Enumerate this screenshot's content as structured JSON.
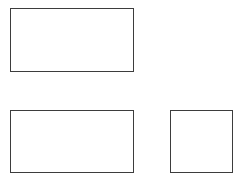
{
  "canvas": {
    "width": 240,
    "height": 180,
    "background_color": "#ffffff"
  },
  "diagram": {
    "title": "",
    "shape_count": 3,
    "default_stroke_color": "#3d3d3d",
    "default_fill_color": "#ffffff",
    "default_stroke_width": 1
  },
  "shapes": [
    {
      "id": "rect-top-left",
      "kind": "rectangle",
      "label": "",
      "x": 10,
      "y": 8,
      "width": 124,
      "height": 64,
      "stroke_color": "#3d3d3d",
      "fill_color": "#ffffff",
      "stroke_width": 1
    },
    {
      "id": "rect-bottom-left",
      "kind": "rectangle",
      "label": "",
      "x": 10,
      "y": 110,
      "width": 124,
      "height": 63,
      "stroke_color": "#3d3d3d",
      "fill_color": "#ffffff",
      "stroke_width": 1
    },
    {
      "id": "square-bottom-right",
      "kind": "square",
      "label": "",
      "x": 170,
      "y": 110,
      "width": 63,
      "height": 63,
      "stroke_color": "#3d3d3d",
      "fill_color": "#ffffff",
      "stroke_width": 1
    }
  ]
}
